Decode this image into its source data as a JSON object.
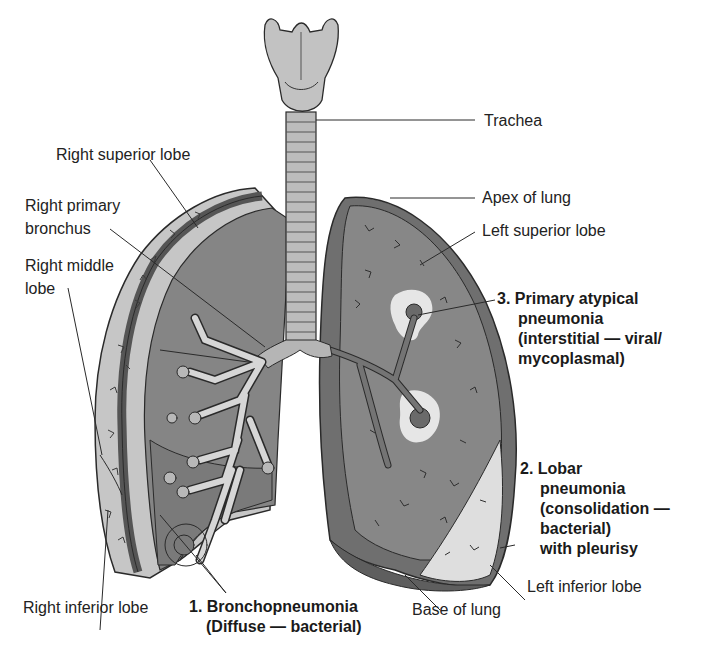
{
  "diagram": {
    "colors": {
      "lung_dark": "#7b7b7b",
      "lung_pleura": "#5e5e5e",
      "lung_light": "#c9c9c9",
      "consolidation": "#e4e4e4",
      "trachea": "#bdbdbd",
      "line": "#2a2a2a"
    }
  },
  "labels": {
    "trachea": "Trachea",
    "apex_of_lung": "Apex of lung",
    "left_superior_lobe": "Left superior lobe",
    "right_superior_lobe": "Right superior lobe",
    "right_primary_bronchus_1": "Right primary",
    "right_primary_bronchus_2": "bronchus",
    "right_middle_lobe_1": "Right middle",
    "right_middle_lobe_2": "lobe",
    "right_inferior_lobe": "Right inferior lobe",
    "left_inferior_lobe": "Left inferior lobe",
    "base_of_lung": "Base of lung"
  },
  "pneumonia_types": [
    {
      "number": "1.",
      "lines": [
        "1. Bronchopneumonia",
        "(Diffuse — bacterial)"
      ]
    },
    {
      "number": "2.",
      "lines": [
        "2. Lobar",
        "pneumonia",
        "(consolidation —",
        "bacterial)",
        "with pleurisy"
      ]
    },
    {
      "number": "3.",
      "lines": [
        "3. Primary atypical",
        "pneumonia",
        "(interstitial — viral/",
        "mycoplasmal)"
      ]
    }
  ]
}
